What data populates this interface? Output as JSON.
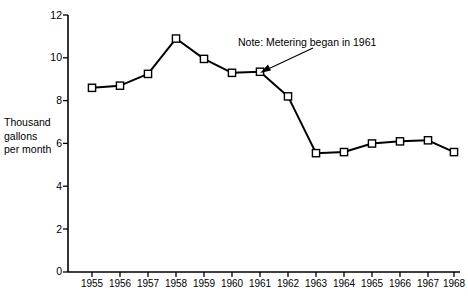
{
  "chart_data": {
    "type": "line",
    "title": "",
    "xlabel": "",
    "ylabel": "Thousand gallons per month",
    "ylabel_lines": [
      "Thousand",
      "gallons",
      "per month"
    ],
    "categories": [
      "1955",
      "1956",
      "1957",
      "1958",
      "1959",
      "1960",
      "1961",
      "1962",
      "1963",
      "1964",
      "1965",
      "1966",
      "1967",
      "1968"
    ],
    "values": [
      8.6,
      8.7,
      9.25,
      10.9,
      9.95,
      9.3,
      9.35,
      8.2,
      5.55,
      5.6,
      6.0,
      6.1,
      6.15,
      5.6
    ],
    "ylim": [
      0,
      12
    ],
    "yticks": [
      0,
      2,
      4,
      6,
      8,
      10,
      12
    ],
    "ytick_labels": [
      "0",
      "2",
      "4",
      "6",
      "8",
      "10",
      "12"
    ],
    "grid": false,
    "legend": null,
    "marker": "open-square",
    "line_color": "#000000",
    "marker_fill": "#ffffff",
    "marker_stroke": "#000000",
    "annotations": [
      {
        "text": "Note: Metering began in 1961",
        "points_to_category": "1961",
        "points_to_value": 9.35
      }
    ]
  },
  "caption": {
    "text": ""
  }
}
